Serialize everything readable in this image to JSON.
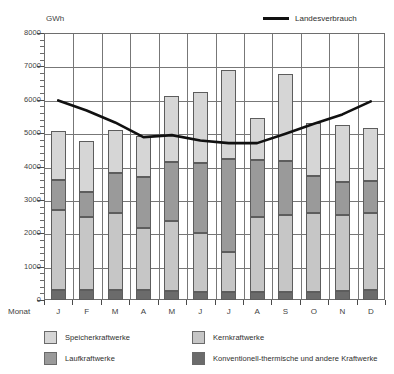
{
  "chart_data": {
    "type": "bar",
    "title": "",
    "subtitle": "",
    "unit_label": "GWh",
    "xlabel": "Monat",
    "ylabel": "",
    "ylim": [
      0,
      8000
    ],
    "ytick_step": 1000,
    "yminor_step": 200,
    "grid": true,
    "stacked": true,
    "categories": [
      "J",
      "F",
      "M",
      "A",
      "M",
      "J",
      "J",
      "A",
      "S",
      "O",
      "N",
      "D"
    ],
    "ytick_labels": [
      "0",
      "1000",
      "2000",
      "3000",
      "4000",
      "5000",
      "6000",
      "7000",
      "8000"
    ],
    "legend_position": "bottom",
    "series": [
      {
        "name": "Konventionell-thermische und andere Kraftwerke",
        "color": "#6b6b6b",
        "stack_order": 1,
        "values": [
          300,
          290,
          300,
          300,
          270,
          250,
          230,
          230,
          240,
          250,
          260,
          290
        ]
      },
      {
        "name": "Kernkraftwerke",
        "color": "#c6c6c6",
        "stack_order": 2,
        "values": [
          2400,
          2210,
          2310,
          1870,
          2090,
          1770,
          1210,
          2260,
          2310,
          2350,
          2290,
          2310
        ]
      },
      {
        "name": "Laufkraftwerke",
        "color": "#9a9a9a",
        "stack_order": 3,
        "values": [
          900,
          730,
          1190,
          1530,
          1780,
          2080,
          2770,
          1700,
          1610,
          1110,
          1000,
          970
        ]
      },
      {
        "name": "Speicherkraftwerke",
        "color": "#d6d6d6",
        "stack_order": 4,
        "values": [
          1450,
          1520,
          1300,
          1200,
          1960,
          2120,
          2680,
          1250,
          2620,
          1590,
          1700,
          1590
        ]
      }
    ],
    "totals": [
      5050,
      4750,
      5100,
      4900,
      6100,
      6220,
      6890,
      5440,
      6780,
      5300,
      5250,
      5160
    ],
    "line_series": {
      "name": "Landesverbrauch",
      "color": "#111111",
      "values": [
        5980,
        5680,
        5320,
        4880,
        4940,
        4780,
        4700,
        4700,
        4980,
        5280,
        5560,
        5950
      ]
    }
  },
  "legend": {
    "line_entry": "Landesverbrauch",
    "entries": [
      {
        "label": "Speicherkraftwerke",
        "color": "#d6d6d6"
      },
      {
        "label": "Kernkraftwerke",
        "color": "#c6c6c6"
      },
      {
        "label": "Laufkraftwerke",
        "color": "#9a9a9a"
      },
      {
        "label": "Konventionell-thermische und andere Kraftwerke",
        "color": "#6b6b6b"
      }
    ]
  }
}
